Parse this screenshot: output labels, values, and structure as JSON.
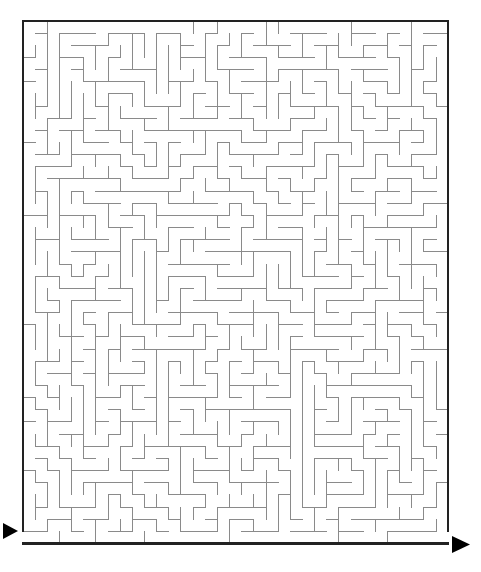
{
  "document": {
    "type": "maze-puzzle",
    "title": "Maze Puzzle",
    "background_color": "#ffffff",
    "canvas": {
      "width": 481,
      "height": 572
    }
  },
  "maze": {
    "name": "rectangular-perfect-maze",
    "columns": 35,
    "rows": 43,
    "cell_size": 12.15,
    "origin_x": 23,
    "origin_y": 21,
    "width_px": 425,
    "height_px": 524,
    "seed": 20240517,
    "border_color": "#222222",
    "border_width": 2.2,
    "wall_color": "#8a8a8a",
    "wall_width": 1,
    "passage_color": "#ffffff"
  },
  "entrance": {
    "label": "Start",
    "side": "left",
    "cell_row": 42,
    "cell_col": 0,
    "arrow_direction": "right",
    "arrow_color": "#000000",
    "arrow_x": 3,
    "arrow_y": 523,
    "arrow_width": 15,
    "arrow_height": 16
  },
  "exit": {
    "label": "Finish",
    "side": "right",
    "cell_row": 42,
    "cell_col": 34,
    "arrow_direction": "right",
    "arrow_color": "#000000",
    "arrow_x": 452,
    "arrow_y": 536,
    "arrow_width": 18,
    "arrow_height": 17
  }
}
